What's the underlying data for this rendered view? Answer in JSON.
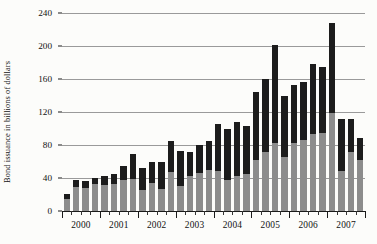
{
  "chart_data": {
    "type": "bar",
    "title": "",
    "subtitle": "",
    "xlabel": "",
    "ylabel": "Bond issuance in billions of dollars",
    "ylim": [
      0,
      240
    ],
    "yticks": [
      0,
      40,
      80,
      120,
      160,
      200,
      240
    ],
    "ytick_labels": [
      "0",
      "40",
      "80",
      "120",
      "160",
      "200",
      "240"
    ],
    "grid": true,
    "legend_position": "none",
    "stacked": true,
    "bar_color_lower": "#8c8c8c",
    "bar_color_upper": "#1c1c1c",
    "background_color": "#fcfcfa",
    "categories": [
      "2000 Q1",
      "2000 Q2",
      "2000 Q3",
      "2000 Q4",
      "2001 Q1",
      "2001 Q2",
      "2001 Q3",
      "2001 Q4",
      "2002 Q1",
      "2002 Q2",
      "2002 Q3",
      "2002 Q4",
      "2003 Q1",
      "2003 Q2",
      "2003 Q3",
      "2003 Q4",
      "2004 Q1",
      "2004 Q2",
      "2004 Q3",
      "2004 Q4",
      "2005 Q1",
      "2005 Q2",
      "2005 Q3",
      "2005 Q4",
      "2006 Q1",
      "2006 Q2",
      "2006 Q3",
      "2006 Q4",
      "2007 Q1",
      "2007 Q2",
      "2007 Q3",
      "2007 Q4"
    ],
    "x_group_labels": [
      "2000",
      "2001",
      "2002",
      "2003",
      "2004",
      "2005",
      "2006",
      "2007"
    ],
    "series": [
      {
        "name": "lower",
        "values": [
          14,
          29,
          28,
          33,
          31,
          33,
          38,
          39,
          26,
          34,
          27,
          47,
          30,
          43,
          46,
          50,
          48,
          38,
          42,
          45,
          62,
          72,
          82,
          66,
          82,
          86,
          93,
          95,
          119,
          48,
          72,
          62
        ]
      },
      {
        "name": "upper",
        "values": [
          7,
          9,
          8,
          7,
          12,
          12,
          17,
          30,
          26,
          25,
          33,
          38,
          43,
          29,
          34,
          35,
          58,
          62,
          66,
          58,
          82,
          88,
          119,
          74,
          71,
          71,
          85,
          80,
          109,
          64,
          40,
          26
        ]
      }
    ],
    "totals": [
      21,
      38,
      36,
      40,
      43,
      45,
      55,
      69,
      52,
      59,
      60,
      85,
      73,
      72,
      80,
      85,
      106,
      100,
      108,
      103,
      144,
      160,
      201,
      140,
      153,
      157,
      178,
      175,
      228,
      112,
      112,
      88
    ]
  }
}
